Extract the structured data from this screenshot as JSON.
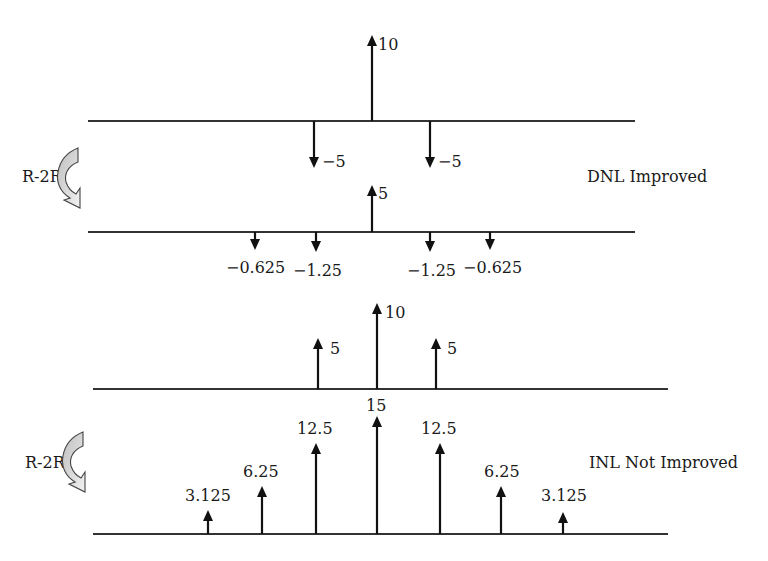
{
  "diagram": {
    "panels": [
      {
        "id": "dnl",
        "caption": "DNL Improved",
        "transform_label": "R-2R",
        "before": {
          "baseline_y": 121,
          "x1": 88,
          "x2": 635,
          "impulses": [
            {
              "x": 314,
              "value": -5,
              "label": "−5",
              "tip": 168,
              "lx": 322,
              "ly": 167
            },
            {
              "x": 372,
              "value": 10,
              "label": "10",
              "tip": 35,
              "lx": 378,
              "ly": 50
            },
            {
              "x": 430,
              "value": -5,
              "label": "−5",
              "tip": 168,
              "lx": 438,
              "ly": 167
            }
          ]
        },
        "after": {
          "baseline_y": 232,
          "x1": 88,
          "x2": 635,
          "impulses": [
            {
              "x": 255,
              "value": -0.625,
              "label": "−0.625",
              "tip": 250,
              "lx": 226,
              "ly": 273
            },
            {
              "x": 316,
              "value": -1.25,
              "label": "−1.25",
              "tip": 252,
              "lx": 293,
              "ly": 276
            },
            {
              "x": 372,
              "value": 5,
              "label": "5",
              "tip": 185,
              "lx": 378,
              "ly": 199
            },
            {
              "x": 430,
              "value": -1.25,
              "label": "−1.25",
              "tip": 252,
              "lx": 407,
              "ly": 276
            },
            {
              "x": 490,
              "value": -0.625,
              "label": "−0.625",
              "tip": 250,
              "lx": 463,
              "ly": 273
            }
          ]
        }
      },
      {
        "id": "inl",
        "caption": "INL Not Improved",
        "transform_label": "R-2R",
        "before": {
          "baseline_y": 389,
          "x1": 93,
          "x2": 668,
          "impulses": [
            {
              "x": 318,
              "value": 5,
              "label": "5",
              "tip": 338,
              "lx": 330,
              "ly": 354
            },
            {
              "x": 377,
              "value": 10,
              "label": "10",
              "tip": 303,
              "lx": 385,
              "ly": 318
            },
            {
              "x": 436,
              "value": 5,
              "label": "5",
              "tip": 338,
              "lx": 447,
              "ly": 354
            }
          ]
        },
        "after": {
          "baseline_y": 534,
          "x1": 93,
          "x2": 668,
          "impulses": [
            {
              "x": 208,
              "value": 3.125,
              "label": "3.125",
              "tip": 510,
              "lx": 185,
              "ly": 501
            },
            {
              "x": 262,
              "value": 6.25,
              "label": "6.25",
              "tip": 486,
              "lx": 243,
              "ly": 477
            },
            {
              "x": 316,
              "value": 12.5,
              "label": "12.5",
              "tip": 443,
              "lx": 297,
              "ly": 434
            },
            {
              "x": 377,
              "value": 15,
              "label": "15",
              "tip": 416,
              "lx": 366,
              "ly": 411
            },
            {
              "x": 440,
              "value": 12.5,
              "label": "12.5",
              "tip": 443,
              "lx": 421,
              "ly": 434
            },
            {
              "x": 501,
              "value": 6.25,
              "label": "6.25",
              "tip": 486,
              "lx": 484,
              "ly": 477
            },
            {
              "x": 563,
              "value": 3.125,
              "label": "3.125",
              "tip": 512,
              "lx": 541,
              "ly": 501
            }
          ]
        }
      }
    ]
  },
  "labels": {
    "dnl_transform": "R-2R",
    "dnl_caption": "DNL Improved",
    "inl_transform": "R-2R",
    "inl_caption": "INL Not Improved"
  },
  "colors": {
    "ink": "#111111",
    "arrow_fill": "#d9d9d9",
    "background": "#ffffff"
  }
}
